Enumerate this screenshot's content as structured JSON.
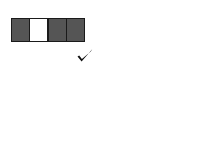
{
  "figure": {
    "background_color": "#ffffff",
    "cell_dark_color": "#555555",
    "cell_light_color": "#ffffff",
    "cell_border_color": "#1a1a1a",
    "mark_color": "#111111",
    "panels": [
      {
        "id": "top-left",
        "shape_name": "four-in-a-row-strip",
        "grid_rows": 1,
        "grid_cols": 4,
        "cells": [
          {
            "row": 0,
            "col": 0,
            "fill": "dark"
          },
          {
            "row": 0,
            "col": 1,
            "fill": "light"
          },
          {
            "row": 0,
            "col": 2,
            "fill": "dark"
          },
          {
            "row": 0,
            "col": 3,
            "fill": "dark"
          }
        ],
        "verdict": "correct",
        "verdict_symbol": "check"
      },
      {
        "id": "top-right",
        "shape_name": "t-tetromino",
        "grid_rows": 3,
        "grid_cols": 3,
        "cells": [
          {
            "row": 0,
            "col": 0,
            "fill": "dark"
          },
          {
            "row": 0,
            "col": 1,
            "fill": "light"
          },
          {
            "row": 0,
            "col": 2,
            "fill": "dark"
          },
          {
            "row": 1,
            "col": 1,
            "fill": "light"
          },
          {
            "row": 2,
            "col": 1,
            "fill": "dark"
          }
        ],
        "verdict": "incorrect",
        "verdict_symbol": "x"
      },
      {
        "id": "bottom-left",
        "shape_name": "two-by-two-checker-square",
        "grid_rows": 2,
        "grid_cols": 2,
        "cells": [
          {
            "row": 0,
            "col": 0,
            "fill": "dark"
          },
          {
            "row": 0,
            "col": 1,
            "fill": "light"
          },
          {
            "row": 1,
            "col": 0,
            "fill": "light"
          },
          {
            "row": 1,
            "col": 1,
            "fill": "dark"
          }
        ],
        "verdict": "correct",
        "verdict_symbol": "check"
      },
      {
        "id": "bottom-right",
        "shape_name": "plus-pentomino",
        "grid_rows": 3,
        "grid_cols": 3,
        "cells": [
          {
            "row": 0,
            "col": 1,
            "fill": "dark"
          },
          {
            "row": 1,
            "col": 0,
            "fill": "light"
          },
          {
            "row": 1,
            "col": 1,
            "fill": "light"
          },
          {
            "row": 1,
            "col": 2,
            "fill": "light"
          },
          {
            "row": 2,
            "col": 1,
            "fill": "dark"
          }
        ],
        "verdict": "incorrect",
        "verdict_symbol": "x"
      }
    ],
    "marks": {
      "check_label": "✓",
      "x_label": "x"
    }
  }
}
